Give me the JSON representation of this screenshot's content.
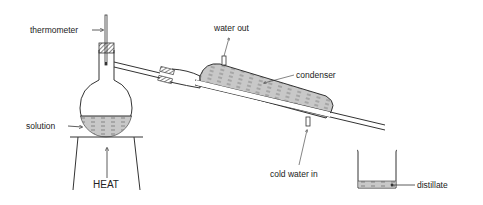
{
  "diagram": {
    "labels": {
      "thermometer": "thermometer",
      "water_out": "water out",
      "condenser": "condenser",
      "solution": "solution",
      "heat": "HEAT",
      "cold_water_in": "cold water in",
      "distillate": "distillate"
    },
    "colors": {
      "line": "#333333",
      "liquid": "#c8c8c8",
      "background": "#ffffff"
    }
  }
}
